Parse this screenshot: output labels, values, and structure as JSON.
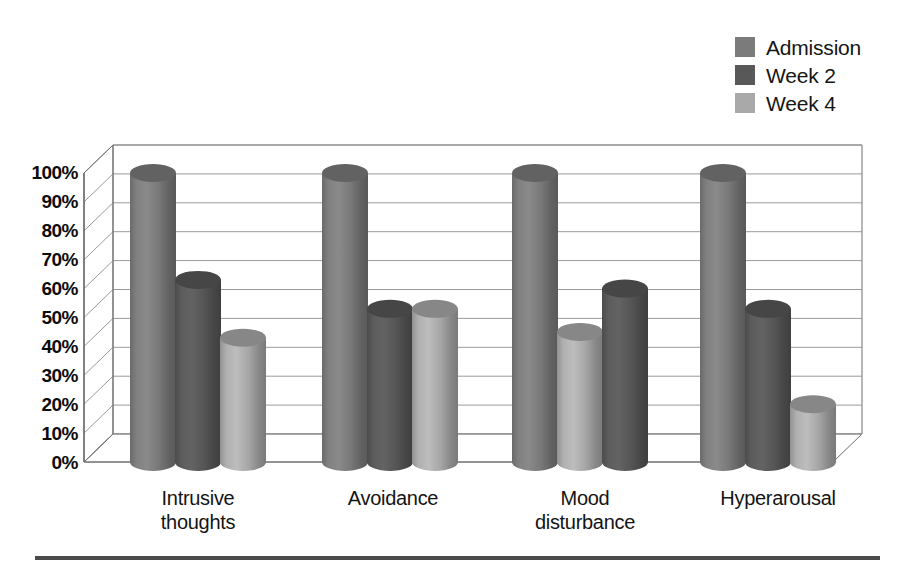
{
  "chart_data": {
    "type": "bar",
    "title": "",
    "subtitle": "",
    "xlabel": "",
    "ylabel": "",
    "categories": [
      "Intrusive\nthoughts",
      "Avoidance",
      "Mood\ndisturbance",
      "Hyperarousal"
    ],
    "series": [
      {
        "name": "Admission",
        "color": "#7b7b7b",
        "values": [
          100,
          100,
          100,
          100
        ]
      },
      {
        "name": "Week 2",
        "color": "#585858",
        "values": [
          63,
          53,
          60,
          53
        ]
      },
      {
        "name": "Week 4",
        "color": "#a9a9a9",
        "values": [
          43,
          53,
          45,
          20
        ]
      }
    ],
    "series_draw_order": [
      [
        "Admission",
        "Week 2",
        "Week 4"
      ],
      [
        "Admission",
        "Week 2",
        "Week 4"
      ],
      [
        "Admission",
        "Week 4",
        "Week 2"
      ],
      [
        "Admission",
        "Week 2",
        "Week 4"
      ]
    ],
    "ylim": [
      0,
      100
    ],
    "ytick_values": [
      0,
      10,
      20,
      30,
      40,
      50,
      60,
      70,
      80,
      90,
      100
    ],
    "ytick_labels": [
      "0%",
      "10%",
      "20%",
      "30%",
      "40%",
      "50%",
      "60%",
      "70%",
      "80%",
      "90%",
      "100%"
    ],
    "grid": true,
    "grid_axis": "y",
    "legend_position": "top-right",
    "style": "3d-cylinder",
    "bar_shape": "cylinder",
    "units": "percent"
  },
  "legend": {
    "items": [
      {
        "label": "Admission",
        "color": "#7b7b7b"
      },
      {
        "label": "Week 2",
        "color": "#585858"
      },
      {
        "label": "Week 4",
        "color": "#a9a9a9"
      }
    ]
  },
  "axis": {
    "y_labels": [
      "100%",
      "90%",
      "80%",
      "70%",
      "60%",
      "50%",
      "40%",
      "30%",
      "20%",
      "10%",
      "0%"
    ],
    "x_labels": [
      "Intrusive\nthoughts",
      "Avoidance",
      "Mood\ndisturbance",
      "Hyperarousal"
    ]
  },
  "colors": {
    "admission": "#7b7b7b",
    "week2": "#585858",
    "week4": "#a9a9a9",
    "gridline": "#9a9a9a",
    "axis": "#6e6e6e",
    "rule": "#4a4a4a",
    "background": "#ffffff"
  }
}
